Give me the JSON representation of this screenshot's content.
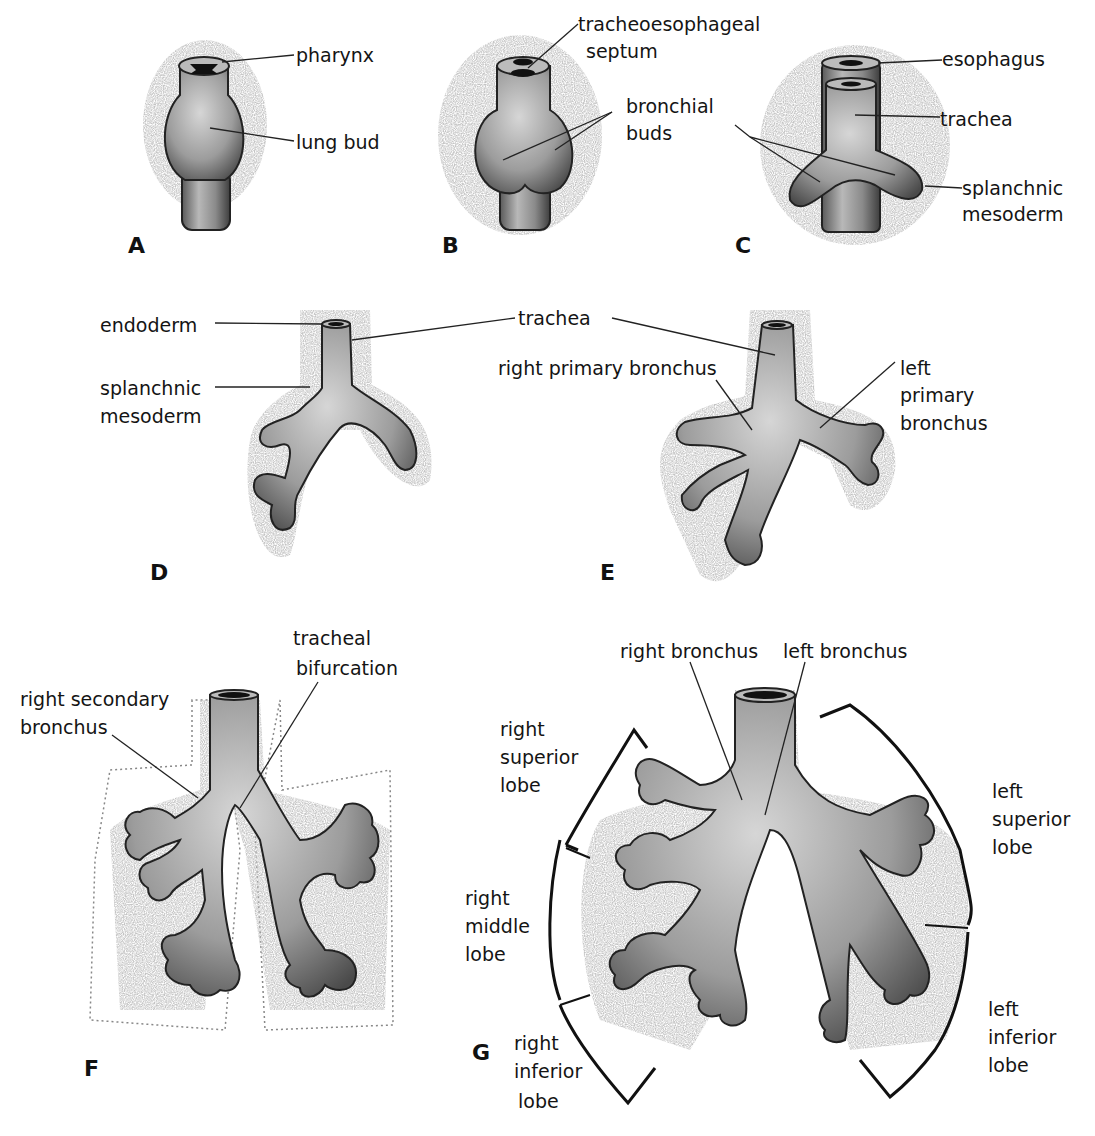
{
  "figure": {
    "panels": [
      {
        "letter": "A",
        "labels": [
          "pharynx",
          "lung bud"
        ]
      },
      {
        "letter": "B",
        "labels": [
          "tracheoesophageal",
          "septum",
          "bronchial",
          "buds"
        ]
      },
      {
        "letter": "C",
        "labels": [
          "esophagus",
          "trachea",
          "splanchnic",
          "mesoderm"
        ]
      },
      {
        "letter": "D",
        "labels": [
          "endoderm",
          "splanchnic",
          "mesoderm"
        ]
      },
      {
        "letter": "E",
        "labels": [
          "trachea",
          "right primary bronchus",
          "left",
          "primary",
          "bronchus"
        ]
      },
      {
        "letter": "F",
        "labels": [
          "tracheal",
          "bifurcation",
          "right secondary",
          "bronchus"
        ]
      },
      {
        "letter": "G",
        "labels": [
          "right bronchus",
          "left bronchus",
          "right",
          "superior",
          "lobe",
          "right",
          "middle",
          "lobe",
          "right",
          "inferior",
          "lobe",
          "left",
          "superior",
          "lobe",
          "left",
          "inferior",
          "lobe"
        ]
      }
    ],
    "colors": {
      "ink": "#141414",
      "tissue": "#9a9a9a",
      "tissue_light": "#c8c8c8",
      "stipple": "#bdbdbd",
      "background": "#ffffff"
    }
  }
}
